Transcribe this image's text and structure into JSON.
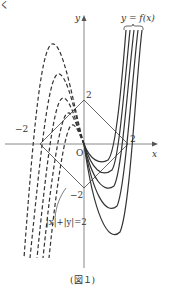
{
  "figure": {
    "caption": "(図１)",
    "corner_mark": "く"
  },
  "axes": {
    "x_label": "x",
    "y_label": "y",
    "origin_label": "O",
    "tick_x_pos": "2",
    "tick_x_neg": "−2",
    "tick_y_pos": "2",
    "tick_y_neg": "−2"
  },
  "annotations": {
    "curve_family_label": "y = f(x)",
    "region_label": "|x|+|y|=2"
  },
  "colors": {
    "stroke": "#333333",
    "axis": "#888888",
    "background": "#ffffff"
  }
}
